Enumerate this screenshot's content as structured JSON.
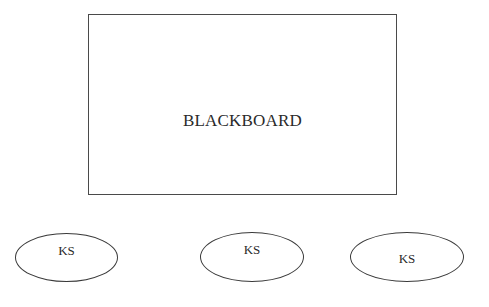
{
  "diagram": {
    "blackboard": {
      "label": "BLACKBOARD"
    },
    "knowledge_sources": [
      {
        "label": "KS"
      },
      {
        "label": "KS"
      },
      {
        "label": "KS"
      }
    ]
  },
  "colors": {
    "stroke": "#3a3a3a",
    "text": "#2a2a2a",
    "background": "#ffffff"
  }
}
